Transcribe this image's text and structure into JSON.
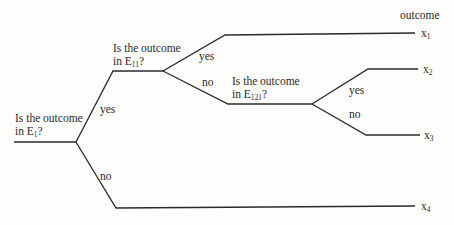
{
  "diagram": {
    "type": "decision-tree",
    "header": "outcome",
    "questions": [
      {
        "id": "q1",
        "line1": "Is the outcome",
        "line2_prefix": "in E",
        "line2_sub": "1",
        "line2_suffix": "?"
      },
      {
        "id": "q11",
        "line1": "Is the outcome",
        "line2_prefix": "in E",
        "line2_sub": "11",
        "line2_suffix": "?"
      },
      {
        "id": "q121",
        "line1": "Is the outcome",
        "line2_prefix": "in E",
        "line2_sub": "121",
        "line2_suffix": "?"
      }
    ],
    "branch_labels": {
      "q1_yes": "yes",
      "q1_no": "no",
      "q11_yes": "yes",
      "q11_no": "no",
      "q121_yes": "yes",
      "q121_no": "no"
    },
    "outcomes": [
      {
        "base": "x",
        "sub": "1"
      },
      {
        "base": "x",
        "sub": "2"
      },
      {
        "base": "x",
        "sub": "3"
      },
      {
        "base": "x",
        "sub": "4"
      }
    ],
    "line_color": "#2a2a2a"
  }
}
